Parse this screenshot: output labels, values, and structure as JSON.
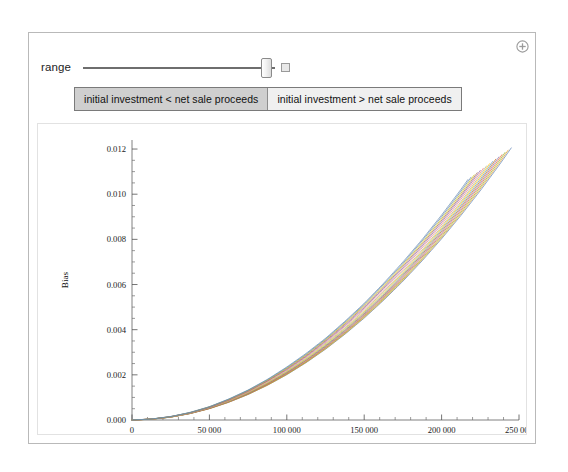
{
  "panel": {
    "plus_icon": "plus-circle-icon"
  },
  "controls": {
    "slider_label": "range",
    "slider_value_fraction": 0.93,
    "animate_button_label": "",
    "setter_options": [
      {
        "label": "initial investment < net sale proceeds",
        "selected": true
      },
      {
        "label": "initial investment > net sale proceeds",
        "selected": false
      }
    ]
  },
  "chart_data": {
    "type": "line",
    "title": "",
    "xlabel": "Cash Flow Range",
    "ylabel": "Bias",
    "xlim": [
      0,
      250000
    ],
    "ylim": [
      0,
      0.0124
    ],
    "grid": false,
    "legend": null,
    "x_ticks": [
      0,
      50000,
      100000,
      150000,
      200000,
      250000
    ],
    "x_tick_labels": [
      "0",
      "50 000",
      "100 000",
      "150 000",
      "200 000",
      "250 000"
    ],
    "x_minor_ticks": [
      10000,
      20000,
      30000,
      40000,
      60000,
      70000,
      80000,
      90000,
      110000,
      120000,
      130000,
      140000,
      160000,
      170000,
      180000,
      190000,
      210000,
      220000,
      230000,
      240000
    ],
    "y_ticks": [
      0.0,
      0.002,
      0.004,
      0.006,
      0.008,
      0.01,
      0.012
    ],
    "y_tick_labels": [
      "0.000",
      "0.002",
      "0.004",
      "0.006",
      "0.008",
      "0.010",
      "0.012"
    ],
    "y_minor_ticks": [
      0.0005,
      0.001,
      0.0015,
      0.0025,
      0.003,
      0.0035,
      0.0045,
      0.005,
      0.0055,
      0.0065,
      0.007,
      0.0075,
      0.0085,
      0.009,
      0.0095,
      0.0105,
      0.011,
      0.0115
    ],
    "x": [
      0,
      12500,
      25000,
      37500,
      50000,
      62500,
      75000,
      87500,
      100000,
      112500,
      125000,
      137500,
      150000,
      162500,
      175000,
      187500,
      200000,
      212500,
      225000,
      237500,
      250000
    ],
    "series": [
      {
        "name": "curve-1",
        "color": "#5e81b5",
        "x_end": 245000,
        "y_end": 0.01205,
        "values": [
          0.0,
          4e-05,
          0.00015,
          0.00034,
          0.0006,
          0.00094,
          0.00135,
          0.00184,
          0.0024,
          0.00304,
          0.00375,
          0.00454,
          0.0054,
          0.00634,
          0.00735,
          0.00844,
          0.0096,
          0.01084,
          0.01215,
          0.01354,
          0.015
        ]
      },
      {
        "name": "curve-2",
        "color": "#e19c24",
        "x_end": 243000,
        "y_end": 0.01195,
        "values": [
          0.0,
          4e-05,
          0.00015,
          0.00033,
          0.00058,
          0.00091,
          0.00131,
          0.00178,
          0.00233,
          0.00295,
          0.00364,
          0.00441,
          0.00525,
          0.00616,
          0.00715,
          0.00821,
          0.00934,
          0.01055,
          0.01183,
          0.01318,
          0.01461
        ]
      },
      {
        "name": "curve-3",
        "color": "#8fb032",
        "x_end": 241000,
        "y_end": 0.01185,
        "values": [
          0.0,
          4e-05,
          0.00014,
          0.00032,
          0.00057,
          0.00089,
          0.00128,
          0.00174,
          0.00227,
          0.00287,
          0.00355,
          0.00429,
          0.00511,
          0.00599,
          0.00695,
          0.00798,
          0.00908,
          0.01026,
          0.0115,
          0.01282,
          0.01421
        ]
      },
      {
        "name": "curve-4",
        "color": "#eb6235",
        "x_end": 239000,
        "y_end": 0.01175,
        "values": [
          0.0,
          4e-05,
          0.00014,
          0.00031,
          0.00055,
          0.00086,
          0.00124,
          0.00169,
          0.00221,
          0.00279,
          0.00345,
          0.00417,
          0.00496,
          0.00583,
          0.00676,
          0.00776,
          0.00883,
          0.00997,
          0.01118,
          0.01246,
          0.01381
        ]
      },
      {
        "name": "curve-5",
        "color": "#8778b3",
        "x_end": 237000,
        "y_end": 0.01165,
        "values": [
          0.0,
          4e-05,
          0.00014,
          0.0003,
          0.00054,
          0.00084,
          0.00121,
          0.00165,
          0.00215,
          0.00272,
          0.00335,
          0.00405,
          0.00482,
          0.00566,
          0.00656,
          0.00753,
          0.00857,
          0.00968,
          0.01085,
          0.0121,
          0.01341
        ]
      },
      {
        "name": "curve-6",
        "color": "#c56e1a",
        "x_end": 235000,
        "y_end": 0.01155,
        "values": [
          0.0,
          4e-05,
          0.00013,
          0.0003,
          0.00052,
          0.00082,
          0.00118,
          0.0016,
          0.00209,
          0.00264,
          0.00326,
          0.00394,
          0.00468,
          0.00549,
          0.00637,
          0.00731,
          0.00832,
          0.00939,
          0.01053,
          0.01174,
          0.01301
        ]
      },
      {
        "name": "curve-7",
        "color": "#5d9ec7",
        "x_end": 233000,
        "y_end": 0.01145,
        "values": [
          0.0,
          3e-05,
          0.00013,
          0.00029,
          0.00051,
          0.00079,
          0.00114,
          0.00156,
          0.00203,
          0.00257,
          0.00316,
          0.00382,
          0.00454,
          0.00532,
          0.00617,
          0.00708,
          0.00806,
          0.0091,
          0.0102,
          0.01137,
          0.01261
        ]
      },
      {
        "name": "curve-8",
        "color": "#ffbf00",
        "x_end": 231000,
        "y_end": 0.01135,
        "values": [
          0.0,
          3e-05,
          0.00013,
          0.00028,
          0.0005,
          0.00077,
          0.00111,
          0.00151,
          0.00197,
          0.00249,
          0.00307,
          0.00371,
          0.0044,
          0.00516,
          0.00598,
          0.00686,
          0.0078,
          0.00881,
          0.00988,
          0.01101,
          0.01221
        ]
      },
      {
        "name": "curve-9",
        "color": "#a5b592",
        "x_end": 229000,
        "y_end": 0.01125,
        "values": [
          0.0,
          3e-05,
          0.00012,
          0.00027,
          0.00048,
          0.00075,
          0.00108,
          0.00147,
          0.00191,
          0.00242,
          0.00298,
          0.00359,
          0.00427,
          0.005,
          0.00579,
          0.00663,
          0.00754,
          0.00851,
          0.00955,
          0.01065,
          0.01181
        ]
      },
      {
        "name": "curve-10",
        "color": "#f08080",
        "x_end": 227000,
        "y_end": 0.01115,
        "values": [
          0.0,
          3e-05,
          0.00012,
          0.00026,
          0.00047,
          0.00073,
          0.00105,
          0.00143,
          0.00186,
          0.00235,
          0.00289,
          0.00349,
          0.00414,
          0.00485,
          0.00561,
          0.00643,
          0.0073,
          0.00824,
          0.00923,
          0.01029,
          0.01141
        ]
      },
      {
        "name": "curve-11",
        "color": "#9067a7",
        "x_end": 225000,
        "y_end": 0.01105,
        "values": [
          0.0,
          3e-05,
          0.00012,
          0.00026,
          0.00045,
          0.00071,
          0.00102,
          0.00139,
          0.0018,
          0.00227,
          0.0028,
          0.00337,
          0.004,
          0.00469,
          0.00542,
          0.00621,
          0.00705,
          0.00795,
          0.0089,
          0.00992,
          0.01099
        ]
      },
      {
        "name": "curve-12",
        "color": "#ab6857",
        "x_end": 223000,
        "y_end": 0.01095,
        "values": [
          0.0,
          3e-05,
          0.00011,
          0.00025,
          0.00044,
          0.00069,
          0.00099,
          0.00134,
          0.00175,
          0.0022,
          0.00271,
          0.00327,
          0.00388,
          0.00454,
          0.00525,
          0.00601,
          0.00682,
          0.00768,
          0.0086,
          0.00957,
          0.01059
        ]
      },
      {
        "name": "curve-13",
        "color": "#ccc210",
        "x_end": 221000,
        "y_end": 0.01085,
        "values": [
          0.0,
          3e-05,
          0.00011,
          0.00024,
          0.00043,
          0.00067,
          0.00096,
          0.0013,
          0.00169,
          0.00213,
          0.00262,
          0.00316,
          0.00375,
          0.00438,
          0.00507,
          0.0058,
          0.00658,
          0.00741,
          0.00829,
          0.00922,
          0.0102
        ]
      },
      {
        "name": "curve-14",
        "color": "#5e81b5",
        "x_end": 219000,
        "y_end": 0.01075,
        "values": [
          0.0,
          3e-05,
          0.00011,
          0.00023,
          0.00041,
          0.00065,
          0.00093,
          0.00126,
          0.00164,
          0.00206,
          0.00253,
          0.00306,
          0.00362,
          0.00424,
          0.0049,
          0.00561,
          0.00636,
          0.00716,
          0.008,
          0.0089,
          0.00984
        ]
      },
      {
        "name": "curve-15",
        "color": "#6b8fb0",
        "x_end": 217000,
        "y_end": 0.01065,
        "values": [
          0.0,
          3e-05,
          0.0001,
          0.00023,
          0.0004,
          0.00063,
          0.0009,
          0.00122,
          0.00159,
          0.002,
          0.00245,
          0.00296,
          0.0035,
          0.0041,
          0.00474,
          0.00542,
          0.00615,
          0.00692,
          0.00774,
          0.0086,
          0.00951
        ]
      }
    ]
  }
}
